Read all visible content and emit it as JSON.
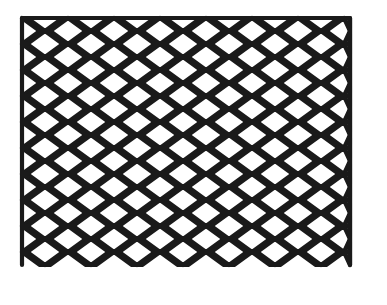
{
  "image": {
    "subject": "Expanded metal mesh",
    "description": "Black expanded metal diamond/hexagonal mesh sheet on white background",
    "colors": {
      "background": "#ffffff",
      "mesh": "#1a1a1a"
    },
    "mesh": {
      "left": 22,
      "top": 18,
      "right": 350,
      "bottom": 272,
      "cell_width": 46,
      "row_pitch": 13,
      "strand_width": 4.2
    }
  }
}
